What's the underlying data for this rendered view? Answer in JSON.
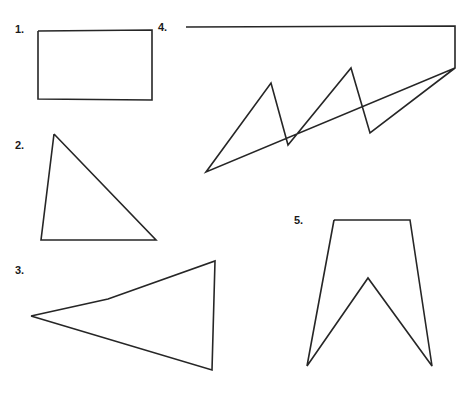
{
  "page": {
    "background_color": "#ffffff",
    "stroke_color": "#262626",
    "label_color": "#1a1a1a",
    "width": 467,
    "height": 399
  },
  "figures": [
    {
      "number": "1.",
      "name": "rectangle",
      "label_x": 15,
      "label_y": 24,
      "sides": 4,
      "points": "38,31 152,30 152,100 38,99 38,31",
      "closed": true
    },
    {
      "number": "2.",
      "name": "right-triangle",
      "label_x": 15,
      "label_y": 140,
      "sides": 3,
      "points": "54,134 156,240 41,240 54,134",
      "closed": true
    },
    {
      "number": "3.",
      "name": "concave-arrowhead-quadrilateral",
      "label_x": 15,
      "label_y": 265,
      "sides": 4,
      "points": "31,316 108,299 215,261 212,370 31,316",
      "closed": true
    },
    {
      "number": "4.",
      "name": "zigzag-polygon",
      "label_x": 158,
      "label_y": 22,
      "sides": 8,
      "points": "186,27 455,26 455,68 206,172 271,83 288,145 351,68 370,133 455,68",
      "closed": false
    },
    {
      "number": "5.",
      "name": "banner-pennant-polygon",
      "label_x": 294,
      "label_y": 215,
      "sides": 6,
      "points": "334,220 410,220 432,366 368,278 307,366 334,220",
      "closed": true
    }
  ]
}
